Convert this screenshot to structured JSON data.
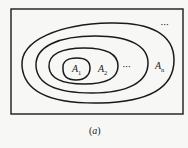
{
  "diagram": {
    "type": "nested-sets",
    "sets": [
      {
        "name": "A",
        "subscript": "1"
      },
      {
        "name": "A",
        "subscript": "2"
      },
      {
        "name": "A",
        "subscript": "n"
      }
    ],
    "ellipsis_inner": "•••",
    "ellipsis_outer": "•••",
    "caption": {
      "open": "(",
      "letter": "a",
      "close": ")"
    }
  }
}
